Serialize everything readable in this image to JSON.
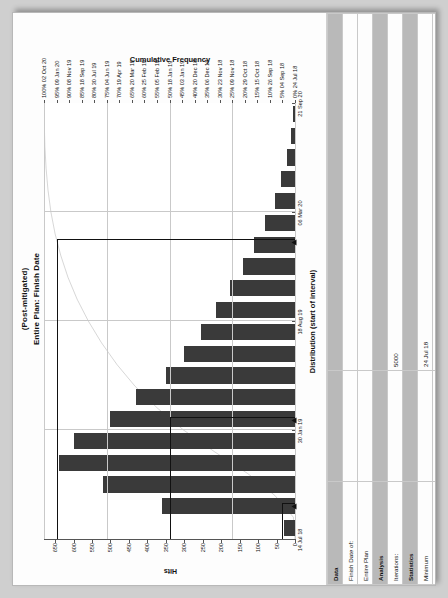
{
  "chart_data": {
    "type": "bar",
    "title": "(Post-mitigated)",
    "subtitle": "Entire Plan: Finish Date",
    "xlabel": "Distribution (start of interval)",
    "ylabel": "Hits",
    "y2label": "Cumulative Frequency",
    "grid": true,
    "legend": "none",
    "ylim": [
      0,
      680
    ],
    "yticks": [
      "0",
      "50",
      "100",
      "150",
      "200",
      "250",
      "300",
      "350",
      "400",
      "450",
      "500",
      "550",
      "600",
      "650"
    ],
    "ytick_values": [
      0,
      50,
      100,
      150,
      200,
      250,
      300,
      350,
      400,
      450,
      500,
      550,
      600,
      650
    ],
    "xticks": [
      "14 Jul 18",
      "30 Jan 19",
      "18 Aug 19",
      "06 Mar 20",
      "21 Sep 20"
    ],
    "categories": [
      "14 Jul 18",
      "26 Aug 18",
      "08 Oct 18",
      "20 Nov 18",
      "02 Jan 19",
      "14 Feb 19",
      "29 Mar 19",
      "11 May 19",
      "23 Jun 19",
      "05 Aug 19",
      "17 Sep 19",
      "30 Oct 19",
      "12 Dec 19",
      "24 Jan 20",
      "07 Mar 20",
      "19 Apr 20",
      "01 Jun 20",
      "14 Jul 20",
      "26 Aug 20",
      "08 Oct 20"
    ],
    "values": [
      30,
      360,
      520,
      640,
      600,
      500,
      430,
      350,
      300,
      255,
      215,
      175,
      140,
      110,
      80,
      55,
      38,
      22,
      12,
      6
    ],
    "cumulative_ticks": [
      {
        "pct": "100%",
        "date": "02 Oct 20"
      },
      {
        "pct": "95%",
        "date": "09 Jan 20"
      },
      {
        "pct": "90%",
        "date": "08 Nov 19"
      },
      {
        "pct": "85%",
        "date": "18 Sep 19"
      },
      {
        "pct": "80%",
        "date": "30 Jul 19"
      },
      {
        "pct": "75%",
        "date": "04 Jun 19"
      },
      {
        "pct": "70%",
        "date": "19 Apr 19"
      },
      {
        "pct": "65%",
        "date": "20 Mar 19"
      },
      {
        "pct": "60%",
        "date": "25 Feb 19"
      },
      {
        "pct": "55%",
        "date": "05 Feb 19"
      },
      {
        "pct": "50%",
        "date": "18 Jan 19"
      },
      {
        "pct": "45%",
        "date": "03 Jan 19"
      },
      {
        "pct": "40%",
        "date": "20 Dec 18"
      },
      {
        "pct": "35%",
        "date": "06 Dec 18"
      },
      {
        "pct": "30%",
        "date": "23 Nov 18"
      },
      {
        "pct": "25%",
        "date": "09 Nov 18"
      },
      {
        "pct": "20%",
        "date": "29 Oct 18"
      },
      {
        "pct": "15%",
        "date": "15 Oct 18"
      },
      {
        "pct": "10%",
        "date": "26 Sep 18"
      },
      {
        "pct": "5%",
        "date": "04 Sep 18"
      },
      {
        "pct": "0%",
        "date": "24 Jul 18"
      }
    ]
  },
  "table": {
    "rows": [
      {
        "type": "section",
        "c1": "Data",
        "c2": "",
        "c3": ""
      },
      {
        "type": "row",
        "c1": "Finish Date of:",
        "c2": "",
        "c3": ""
      },
      {
        "type": "row",
        "c1": "Entire Plan",
        "c2": "",
        "c3": ""
      },
      {
        "type": "section",
        "c1": "Analysis",
        "c2": "",
        "c3": ""
      },
      {
        "type": "row",
        "c1": "Iterations:",
        "c2": "",
        "c3": "5000"
      },
      {
        "type": "section",
        "c1": "Statistics",
        "c2": "",
        "c3": ""
      },
      {
        "type": "row",
        "c1": "Minimum",
        "c2": "",
        "c3": "24 Jul 18"
      },
      {
        "type": "row",
        "c1": "Maximum",
        "c2": "",
        "c3": "02 Oct 20"
      },
      {
        "type": "row",
        "c1": "Mean:",
        "c2": "",
        "c3": "06 Mar 19"
      },
      {
        "type": "row",
        "c1": "Bar Width:",
        "c2": "",
        "c3": "month"
      },
      {
        "type": "section",
        "c1": "Highlighters",
        "c2": "",
        "c3": ""
      },
      {
        "type": "row",
        "c1": "",
        "c2": "Deterministic (30 Aug 18)",
        "c3": "4%"
      },
      {
        "type": "row",
        "c1": "5%",
        "c2": "",
        "c3": "04 Sep 18"
      },
      {
        "type": "row",
        "c1": "95%",
        "c2": "",
        "c3": "09 Jan 20"
      },
      {
        "type": "row",
        "c1": "50%",
        "c2": "",
        "c3": "18 Jan 19"
      }
    ]
  },
  "colors": {
    "bar": "#3a3a3a",
    "section_header": "#b9b9b9",
    "grid": "#c9c9c9",
    "axis": "#555555",
    "page_background": "#cfcfcf"
  }
}
